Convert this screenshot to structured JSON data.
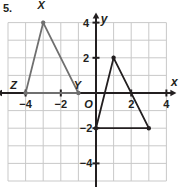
{
  "problem": {
    "number_label": "5."
  },
  "graph": {
    "axis_labels": {
      "x": "x",
      "y": "y",
      "origin": "O"
    },
    "x_ticks": [
      {
        "value": -4,
        "label": "−4"
      },
      {
        "value": -2,
        "label": "−2"
      },
      {
        "value": 2,
        "label": "2"
      },
      {
        "value": 4,
        "label": "4"
      }
    ],
    "y_ticks": [
      {
        "value": 4,
        "label": "4"
      },
      {
        "value": 2,
        "label": "2"
      },
      {
        "value": -2,
        "label": "−2"
      },
      {
        "value": -4,
        "label": "−4"
      }
    ],
    "grid": {
      "x_min": -5,
      "x_max": 4,
      "y_min": -5,
      "y_max": 4,
      "step": 1,
      "visible": true
    },
    "colors": {
      "grid_line": "#c9c9c9",
      "axis": "#231f20",
      "preimage_stroke": "#6f6f6f",
      "image_stroke": "#231f20",
      "label_text": "#231f20"
    }
  },
  "chart_data": {
    "type": "scatter",
    "title": "",
    "xlabel": "x",
    "ylabel": "y",
    "xlim": [
      -5,
      4
    ],
    "ylim": [
      -5,
      4
    ],
    "grid": true,
    "legend": "none",
    "series": [
      {
        "name": "Triangle XYZ (preimage)",
        "color": "#6f6f6f",
        "closed": true,
        "points": [
          {
            "label": "X",
            "x": -3,
            "y": 4
          },
          {
            "label": "Y",
            "x": -1,
            "y": 0
          },
          {
            "label": "Z",
            "x": -4,
            "y": 0
          }
        ]
      },
      {
        "name": "Triangle (image)",
        "color": "#231f20",
        "closed": true,
        "points": [
          {
            "label": "",
            "x": 1,
            "y": 2
          },
          {
            "label": "",
            "x": 3,
            "y": -2
          },
          {
            "label": "",
            "x": 0,
            "y": -2
          }
        ]
      }
    ],
    "vertex_labels": [
      {
        "text": "X",
        "x": -3,
        "y": 4,
        "dx": -2,
        "dy": -14
      },
      {
        "text": "Y",
        "x": -1,
        "y": 0,
        "dx": -1,
        "dy": -4
      },
      {
        "text": "Z",
        "x": -4,
        "y": 0,
        "dx": -12,
        "dy": -4
      }
    ]
  }
}
